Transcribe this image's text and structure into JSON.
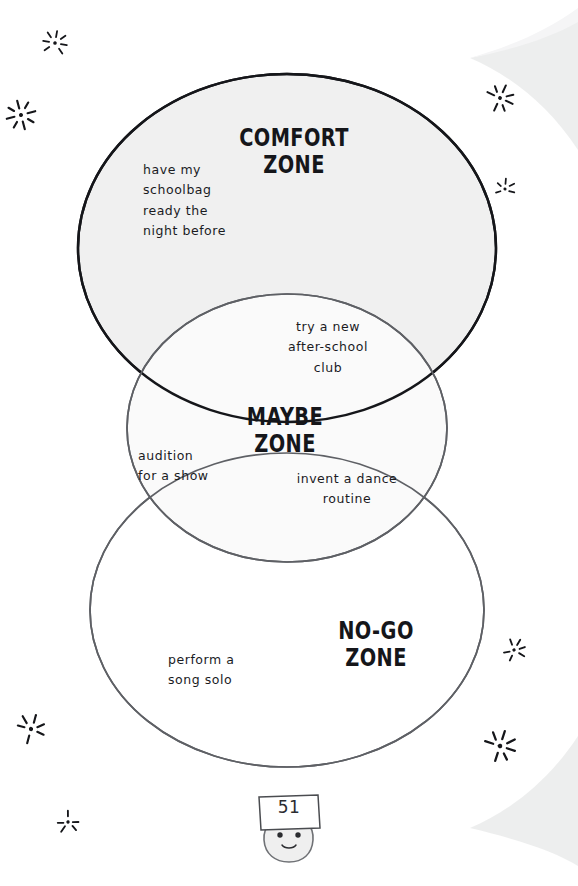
{
  "page": {
    "number": "51",
    "background_color": "#ffffff",
    "corner_shade_color": "#eceded"
  },
  "diagram": {
    "type": "venn",
    "zones": [
      {
        "id": "comfort",
        "title": "COMFORT\nZONE",
        "stroke_color": "#15161a",
        "fill_color": "#f0f0f0",
        "items": [
          {
            "text": "have my\nschoolbag\nready the\nnight before"
          }
        ]
      },
      {
        "id": "maybe",
        "title": "MAYBE\nZONE",
        "stroke_color": "#5e6065",
        "fill_color": "#fafafa",
        "items": [
          {
            "text": "try a new\nafter-school\nclub"
          },
          {
            "text": "audition\nfor a show"
          },
          {
            "text": "invent a dance\nroutine"
          }
        ]
      },
      {
        "id": "nogo",
        "title": "NO-GO\nZONE",
        "stroke_color": "#5e6065",
        "fill_color": "#ffffff",
        "items": [
          {
            "text": "perform a\nsong solo"
          }
        ]
      }
    ],
    "all_items": [
      {
        "text": "have my\nschoolbag\nready the\nnight before",
        "zone": "comfort"
      },
      {
        "text": "try a new\nafter-school\nclub",
        "zone": "maybe"
      },
      {
        "text": "audition\nfor a show",
        "zone": "maybe"
      },
      {
        "text": "invent a dance\nroutine",
        "zone": "maybe"
      },
      {
        "text": "perform a\nsong solo",
        "zone": "nogo"
      }
    ]
  },
  "decorations": {
    "sparkle_color": "#15161a",
    "sparkles": [
      {
        "name": "sparkle-top-left",
        "x": 40,
        "y": 28,
        "size": 30,
        "rotate": 10
      },
      {
        "name": "sparkle-upper-left",
        "x": 4,
        "y": 98,
        "size": 34,
        "rotate": -15
      },
      {
        "name": "sparkle-top-right",
        "x": 484,
        "y": 82,
        "size": 32,
        "rotate": 25
      },
      {
        "name": "sparkle-right-upper",
        "x": 492,
        "y": 176,
        "size": 26,
        "rotate": 5
      },
      {
        "name": "sparkle-right-mid",
        "x": 500,
        "y": 636,
        "size": 28,
        "rotate": -20
      },
      {
        "name": "sparkle-bottom-left",
        "x": 14,
        "y": 712,
        "size": 34,
        "rotate": 15
      },
      {
        "name": "sparkle-lower-left",
        "x": 54,
        "y": 808,
        "size": 28,
        "rotate": -10
      },
      {
        "name": "sparkle-bottom-right",
        "x": 482,
        "y": 728,
        "size": 36,
        "rotate": 18
      }
    ]
  }
}
